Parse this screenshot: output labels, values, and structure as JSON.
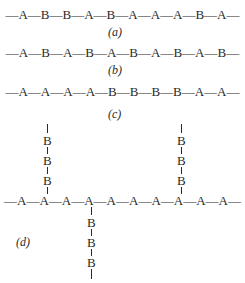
{
  "figures": {
    "a": {
      "chain": "—A—B—B—A—B—A—A—A—B—A—",
      "label": "(a)"
    },
    "b": {
      "chain": "—A—B—A—B—A—B—A—B—A—B—",
      "label": "(b)"
    },
    "c": {
      "chain": "—A—A—A—A—B—B—B—B—A—A—",
      "label": "(c)"
    },
    "d": {
      "chain": "—A—A—A—A—A—A—A—A—A—A—",
      "label": "(d)",
      "branch_left_up": [
        "B",
        "B",
        "B"
      ],
      "branch_right_up": [
        "B",
        "B",
        "B"
      ],
      "branch_down": [
        "B",
        "B",
        "B"
      ]
    }
  }
}
